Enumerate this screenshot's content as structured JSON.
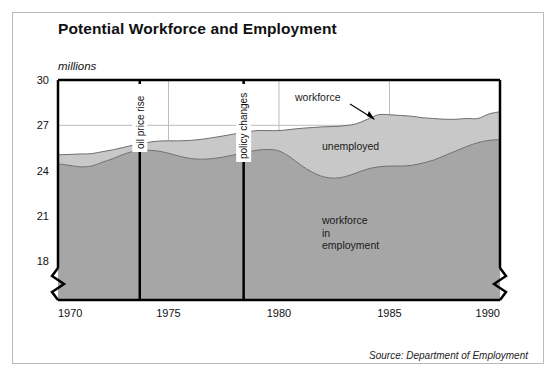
{
  "figure": {
    "title": "Potential Workforce and Employment",
    "units_label": "millions",
    "source": "Source: Department of Employment"
  },
  "colors": {
    "employment_band": "#a6a6a6",
    "unemployed_band": "#c8c8c8",
    "band_stroke": "#6e6e6e",
    "axis": "#000000",
    "gridline": "#bdbdbd",
    "event_line": "#000000",
    "frame_border": "#b9b9b9",
    "text": "#111111",
    "plot_background": "#ffffff"
  },
  "chart_data": {
    "type": "area",
    "title": "Potential Workforce and Employment",
    "subtitle": "",
    "xlabel": "",
    "ylabel": "millions",
    "ylim": [
      16.3,
      30
    ],
    "xlim": [
      1970,
      1990
    ],
    "yticks": [
      18,
      21,
      24,
      27,
      30
    ],
    "ytick_labels": [
      "18",
      "21",
      "24",
      "27",
      "30"
    ],
    "xticks": [
      1970,
      1975,
      1980,
      1985,
      1990
    ],
    "xtick_labels": [
      "1970",
      "1975",
      "1980",
      "1985",
      "1990"
    ],
    "grid": true,
    "legend_position": "inline-annotations",
    "axis_break": {
      "present": true,
      "axis": "y",
      "style": "zigzag",
      "below_value": 18
    },
    "stacked": true,
    "x": [
      1970,
      1970.5,
      1971,
      1971.5,
      1972,
      1972.5,
      1973,
      1973.5,
      1974,
      1974.5,
      1975,
      1975.5,
      1976,
      1976.5,
      1977,
      1977.5,
      1978,
      1978.5,
      1979,
      1979.5,
      1980,
      1980.5,
      1981,
      1981.5,
      1982,
      1982.5,
      1983,
      1983.5,
      1984,
      1984.5,
      1985,
      1985.5,
      1986,
      1986.5,
      1987,
      1987.5,
      1988,
      1988.5,
      1989,
      1989.5,
      1990
    ],
    "series": [
      {
        "name": "workforce in employment",
        "label": "workforce in employment",
        "color": "#a6a6a6",
        "values": [
          24.45,
          24.35,
          24.25,
          24.3,
          24.55,
          24.8,
          25.1,
          25.3,
          25.35,
          25.3,
          25.15,
          24.95,
          24.8,
          24.75,
          24.8,
          24.9,
          25.05,
          25.2,
          25.35,
          25.4,
          25.3,
          24.9,
          24.35,
          23.9,
          23.6,
          23.5,
          23.6,
          23.85,
          24.1,
          24.25,
          24.3,
          24.3,
          24.35,
          24.5,
          24.7,
          25.0,
          25.3,
          25.6,
          25.85,
          26.0,
          26.05
        ]
      },
      {
        "name": "unemployed",
        "label": "unemployed",
        "color": "#c8c8c8",
        "values": [
          0.6,
          0.72,
          0.85,
          0.82,
          0.7,
          0.58,
          0.45,
          0.42,
          0.5,
          0.65,
          0.82,
          1.02,
          1.2,
          1.32,
          1.38,
          1.4,
          1.38,
          1.35,
          1.3,
          1.25,
          1.35,
          1.82,
          2.45,
          2.95,
          3.3,
          3.42,
          3.38,
          3.25,
          3.3,
          3.45,
          3.4,
          3.35,
          3.25,
          3.0,
          2.75,
          2.4,
          2.1,
          1.85,
          1.6,
          1.75,
          1.85
        ]
      }
    ],
    "total_series": {
      "name": "workforce",
      "label": "workforce",
      "description": "top boundary = workforce in employment + unemployed"
    },
    "annotations": [
      {
        "id": "workforce",
        "text": "workforce",
        "type": "arrow-callout",
        "points_to_year": 1983.4,
        "points_to_value": 27.55
      },
      {
        "id": "unemployed",
        "text": "unemployed",
        "type": "band-label",
        "band": "unemployed"
      },
      {
        "id": "workforce-in-employment",
        "text": "workforce\nin\nemployment",
        "lines": [
          "workforce",
          "in",
          "employment"
        ],
        "type": "band-label",
        "band": "workforce in employment"
      }
    ],
    "event_lines": [
      {
        "id": "oil-price-rise",
        "label": "oil price rise",
        "year": 1973.7
      },
      {
        "id": "policy-changes",
        "label": "policy changes",
        "year": 1978.4
      }
    ]
  }
}
